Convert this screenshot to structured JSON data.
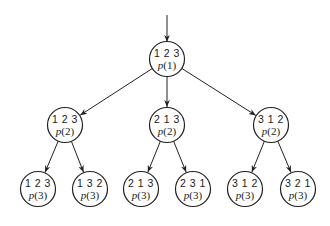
{
  "diagram": {
    "type": "tree",
    "entry_arrow": {
      "from": [
        167,
        15
      ],
      "to": [
        167,
        42
      ]
    },
    "colors": {
      "stroke": "#222222",
      "text": "#1a1a1a",
      "background": "#ffffff"
    },
    "radius": 17.5,
    "nodes": [
      {
        "id": "n0",
        "cx": 167,
        "cy": 59,
        "perm": "1 2 3",
        "prob": "p(1)",
        "level": 1
      },
      {
        "id": "n1",
        "cx": 65,
        "cy": 125,
        "perm": "1 2 3",
        "prob": "p(2)",
        "level": 2
      },
      {
        "id": "n2",
        "cx": 167,
        "cy": 125,
        "perm": "2 1 3",
        "prob": "p(2)",
        "level": 2
      },
      {
        "id": "n3",
        "cx": 271,
        "cy": 125,
        "perm": "3 1 2",
        "prob": "p(2)",
        "level": 2
      },
      {
        "id": "n4",
        "cx": 38,
        "cy": 189,
        "perm": "1 2 3",
        "prob": "p(3)",
        "level": 3
      },
      {
        "id": "n5",
        "cx": 90,
        "cy": 189,
        "perm": "1 3 2",
        "prob": "p(3)",
        "level": 3
      },
      {
        "id": "n6",
        "cx": 141,
        "cy": 189,
        "perm": "2 1 3",
        "prob": "p(3)",
        "level": 3
      },
      {
        "id": "n7",
        "cx": 193,
        "cy": 189,
        "perm": "2 3 1",
        "prob": "p(3)",
        "level": 3
      },
      {
        "id": "n8",
        "cx": 245,
        "cy": 189,
        "perm": "3 1 2",
        "prob": "p(3)",
        "level": 3
      },
      {
        "id": "n9",
        "cx": 298,
        "cy": 189,
        "perm": "3 2 1",
        "prob": "p(3)",
        "level": 3
      }
    ],
    "edges": [
      {
        "from": "n0",
        "to": "n1"
      },
      {
        "from": "n0",
        "to": "n2"
      },
      {
        "from": "n0",
        "to": "n3"
      },
      {
        "from": "n1",
        "to": "n4"
      },
      {
        "from": "n1",
        "to": "n5"
      },
      {
        "from": "n2",
        "to": "n6"
      },
      {
        "from": "n2",
        "to": "n7"
      },
      {
        "from": "n3",
        "to": "n8"
      },
      {
        "from": "n3",
        "to": "n9"
      }
    ]
  }
}
